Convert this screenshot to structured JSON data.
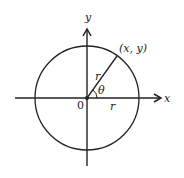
{
  "diagram": {
    "type": "polar-coordinate-circle",
    "labels": {
      "y_axis": "y",
      "x_axis": "x",
      "origin": "0",
      "point": "(x, y)",
      "radius_diagonal": "r",
      "angle": "θ",
      "radius_horizontal": "r"
    },
    "colors": {
      "stroke": "#222222",
      "background": "#ffffff"
    }
  }
}
